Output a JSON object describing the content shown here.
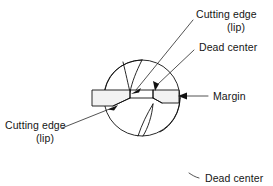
{
  "figure": {
    "background_color": "#ffffff",
    "line_color": "#111111",
    "text_color": "#151515",
    "width": 273,
    "height": 186
  },
  "labels": {
    "cutting_edge_top_line1": "Cutting edge",
    "cutting_edge_top_line2": "(lip)",
    "dead_center_top": "Dead center",
    "margin": "Margin",
    "cutting_edge_bottom_line1": "Cutting edge",
    "cutting_edge_bottom_line2": "(lip)",
    "dead_center_bottom": "Dead center"
  },
  "callouts": [
    {
      "id": "cutting-edge-upper",
      "text": "Cutting edge (lip)",
      "text_x": 196,
      "text_y": 14,
      "leader_from_x": 193,
      "leader_from_y": 20,
      "arrow_to_x": 133,
      "arrow_to_y": 93,
      "arrow_angle_deg": 228
    },
    {
      "id": "dead-center-upper",
      "text": "Dead center",
      "text_x": 198,
      "text_y": 47,
      "leader_from_x": 194,
      "leader_from_y": 50,
      "arrow_to_x": 156,
      "arrow_to_y": 90,
      "arrow_angle_deg": 252
    },
    {
      "id": "margin",
      "text": "Margin",
      "text_x": 212,
      "text_y": 100,
      "leader_from_x": 208,
      "leader_from_y": 96,
      "arrow_to_x": 179,
      "arrow_to_y": 96,
      "arrow_angle_deg": 180
    },
    {
      "id": "cutting-edge-lower",
      "text": "Cutting edge (lip)",
      "text_x": 10,
      "text_y": 130,
      "leader_from_x": 62,
      "leader_from_y": 128,
      "arrow_to_x": 116,
      "arrow_to_y": 106,
      "arrow_angle_deg": 338
    },
    {
      "id": "dead-center-lower",
      "text": "Dead center",
      "text_x": 203,
      "text_y": 181,
      "leader_from_x": 199,
      "leader_from_y": 178,
      "arrow_to_x": 190,
      "arrow_to_y": 174,
      "arrow_angle_deg": 200
    }
  ],
  "geometry": {
    "circle_center_x": 142,
    "circle_center_y": 98,
    "circle_radius": 38,
    "margin_band_left_x": 92,
    "margin_band_right_x": 179,
    "margin_band_top_y": 90,
    "margin_band_bottom_y": 103
  }
}
